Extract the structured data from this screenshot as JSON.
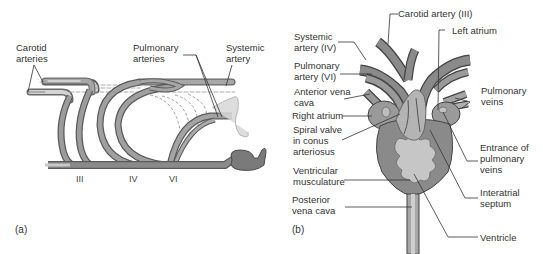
{
  "panel_a": {
    "tag": "(a)",
    "labels": {
      "carotid": "Carotid arteries",
      "pulmonary": "Pulmonary arteries",
      "systemic": "Systemic artery"
    },
    "arch_numbers": [
      "III",
      "IV",
      "VI"
    ]
  },
  "panel_b": {
    "tag": "(b)",
    "labels": {
      "carotid_artery": "Carotid artery (III)",
      "left_atrium": "Left atrium",
      "systemic_artery": "Systemic artery (IV)",
      "pulmonary_artery": "Pulmonary artery (VI)",
      "anterior_vena_cava": "Anterior vena cava",
      "right_atrium": "Right atrium",
      "spiral_valve": "Spiral valve in conus arteriosus",
      "ventricular_musculature": "Ventricular musculature",
      "posterior_vena_cava": "Posterior vena cava",
      "pulmonary_veins": "Pulmonary veins",
      "entrance_pulmonary_veins": "Entrance of pulmonary veins",
      "interatrial_septum": "Interatrial septum",
      "ventricle": "Ventricle"
    }
  },
  "colors": {
    "vessel_dark": "#7a7a7a",
    "vessel_mid": "#9a9a9a",
    "vessel_light": "#c4c4c4",
    "chamber_light": "#c8c8c8",
    "outline": "#4a4a4a",
    "leader": "#333333"
  }
}
